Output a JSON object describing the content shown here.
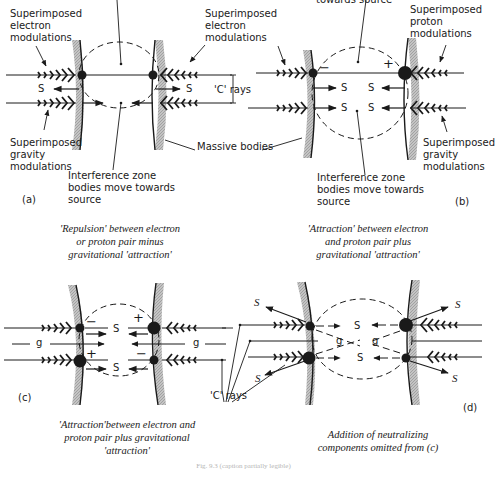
{
  "figure": {
    "footer_caption_faint": "Fig. 9.3 (caption partially legible)"
  },
  "panels": {
    "a": {
      "id": "(a)",
      "labels": {
        "electron_mods_left": "Superimposed\nelectron\nmodulations",
        "electron_mods_right": "Superimposed\nelectron\nmodulations",
        "gravity_mods": "Superimposed\ngravity\nmodulations",
        "interference": "Interference zone\nbodies move towards\nsource",
        "c_rays": "'C' rays",
        "massive_bodies": "Massive bodies"
      },
      "symbols": {
        "s": "S"
      },
      "caption": "'Repulsion' between electron\nor proton pair minus\ngravitational 'attraction'"
    },
    "b": {
      "id": "(b)",
      "labels": {
        "towards_source_cut": "towards source",
        "proton_mods": "Superimposed\nproton\nmodulations",
        "gravity_mods": "Superimposed\ngravity\nmodulations",
        "interference": "Interference zone\nbodies move towards\nsource"
      },
      "symbols": {
        "s": "S",
        "minus": "−",
        "plus": "+"
      },
      "caption": "'Attraction' between electron\nand proton pair plus\ngravitational 'attraction'"
    },
    "c": {
      "id": "(c)",
      "labels": {
        "c_rays": "'C' rays"
      },
      "symbols": {
        "s": "S",
        "g": "g",
        "minus": "−",
        "plus": "+"
      },
      "caption": "'Attraction'between electron and\nproton pair plus gravitational\n'attraction'"
    },
    "d": {
      "id": "(d)",
      "symbols": {
        "s": "S",
        "g": "g",
        "s_italic": "S"
      },
      "caption": "Addition of neutralizing\ncomponents omitted from (c)"
    }
  },
  "colors": {
    "ink": "#1a1a1a",
    "body_shade": "#b8b8b8"
  }
}
